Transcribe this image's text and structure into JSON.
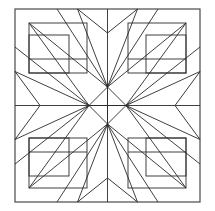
{
  "figure": {
    "background_color": "#ffffff",
    "line_color": "#1c1c1c",
    "frame_color": "#4a4a4a",
    "fill": "none"
  },
  "geometry": {
    "canvas": {
      "width": 215,
      "height": 211
    },
    "frame": {
      "left": 15,
      "top": 9,
      "right": 200,
      "bottom": 202
    },
    "center": {
      "x": 107.5,
      "y": 105.5
    },
    "diamond": {
      "label": "center-diamond",
      "top": {
        "x": 107.5,
        "y": 87
      },
      "right": {
        "x": 126,
        "y": 105.5
      },
      "bottom": {
        "x": 107.5,
        "y": 124
      },
      "left": {
        "x": 89,
        "y": 105.5
      }
    },
    "axes": {
      "vertical_x": 107.5,
      "horizontal_y": 105.5
    },
    "edge_notch": {
      "top_depth": 24,
      "bottom_depth": 24,
      "half_span": 30
    },
    "chevron": {
      "left_tip_x": 40,
      "right_tip_x": 175,
      "half_height": 34
    },
    "corner_block": {
      "inset": 14,
      "size": 58,
      "inner_inset": 12,
      "inner_size": 34
    },
    "ray_count": 16
  },
  "labels": {
    "top_left_corner": "top-left-log-cabin-block",
    "top_right_corner": "top-right-log-cabin-block",
    "bottom_left_corner": "bottom-left-log-cabin-block",
    "bottom_right_corner": "bottom-right-log-cabin-block",
    "center": "center-diamond",
    "sunburst": "radiating-star-rays"
  }
}
